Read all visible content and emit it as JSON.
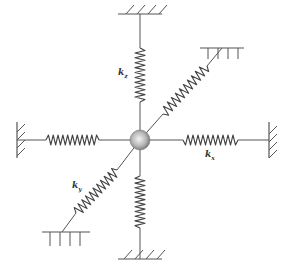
{
  "diagram": {
    "mass": {
      "cx": 140,
      "cy": 140,
      "r": 10,
      "color_light": "#f2f2f2",
      "color_dark": "#7a7a7a"
    },
    "line_color": "#555555",
    "springs": [
      {
        "id": "top",
        "label_k": "k",
        "label_sub": "z",
        "anchor": [
          140,
          14
        ],
        "coil_start": [
          140,
          48
        ],
        "coil_end": [
          140,
          102
        ],
        "ground": "top"
      },
      {
        "id": "bottom",
        "label_k": "",
        "label_sub": "",
        "anchor": [
          140,
          259
        ],
        "coil_start": [
          140,
          176
        ],
        "coil_end": [
          140,
          228
        ],
        "ground": "bottom"
      },
      {
        "id": "left",
        "label_k": "",
        "label_sub": "",
        "anchor": [
          17,
          140
        ],
        "coil_start": [
          46,
          140
        ],
        "coil_end": [
          99,
          140
        ],
        "ground": "left"
      },
      {
        "id": "right",
        "label_k": "k",
        "label_sub": "x",
        "anchor": [
          269,
          140
        ],
        "coil_start": [
          183,
          140
        ],
        "coil_end": [
          238,
          140
        ],
        "ground": "right"
      },
      {
        "id": "diag-upper",
        "label_k": "",
        "label_sub": "",
        "anchor": [
          222,
          48
        ],
        "coil_start": [
          163,
          114
        ],
        "coil_end": [
          207,
          66
        ],
        "ground": "top-ttt"
      },
      {
        "id": "diag-lower",
        "label_k": "k",
        "label_sub": "y",
        "anchor": [
          62,
          232
        ],
        "coil_start": [
          76,
          213
        ],
        "coil_end": [
          117,
          170
        ],
        "ground": "bottom-ttt"
      }
    ],
    "labels": {
      "kz": {
        "k": "k",
        "sub": "z",
        "x": 118,
        "y": 68
      },
      "kx": {
        "k": "k",
        "sub": "x",
        "x": 205,
        "y": 150
      },
      "ky": {
        "k": "k",
        "sub": "y",
        "x": 72,
        "y": 181
      }
    }
  }
}
